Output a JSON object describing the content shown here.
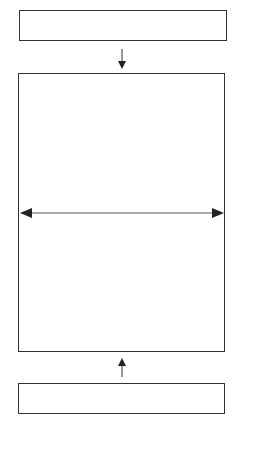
{
  "diagram": {
    "type": "block-diagram",
    "stroke_color": "#333333",
    "background": "#ffffff",
    "nodes": [
      {
        "id": "top-box",
        "label": "",
        "x": 19,
        "y": 10,
        "w": 208,
        "h": 31
      },
      {
        "id": "center-box",
        "label": "",
        "x": 18,
        "y": 73,
        "w": 207,
        "h": 279
      },
      {
        "id": "bottom-box",
        "label": "",
        "x": 18,
        "y": 383,
        "w": 207,
        "h": 31
      }
    ],
    "edges": [
      {
        "from": "top-box",
        "to": "center-box",
        "direction": "down"
      },
      {
        "from": "bottom-box",
        "to": "center-box",
        "direction": "up"
      },
      {
        "id": "width-arrow",
        "type": "double-headed",
        "direction": "horizontal",
        "within": "center-box"
      }
    ]
  }
}
